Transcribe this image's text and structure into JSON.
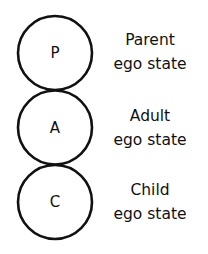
{
  "states": [
    {
      "letter": "P",
      "name": "Parent",
      "subtitle": "ego state"
    },
    {
      "letter": "A",
      "name": "Adult",
      "subtitle": "ego state"
    },
    {
      "letter": "C",
      "name": "Child",
      "subtitle": "ego state"
    }
  ]
}
